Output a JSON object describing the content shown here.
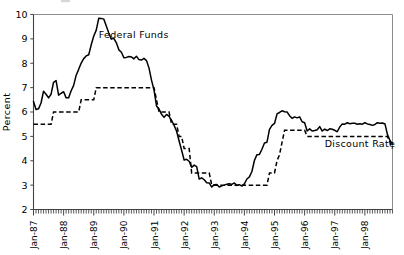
{
  "chart_data": {
    "type": "line",
    "title": "",
    "xlabel": "",
    "ylabel": "Percent",
    "ylim": [
      2,
      10
    ],
    "ytick_labels": [
      "10",
      "9",
      "8",
      "7",
      "6",
      "5",
      "4",
      "3",
      "2"
    ],
    "ytick_values": [
      10,
      9,
      8,
      7,
      6,
      5,
      4,
      3,
      2
    ],
    "xtick_labels": [
      "Jan-87",
      "Jan-88",
      "Jan-89",
      "Jan-90",
      "Jan-91",
      "Jan-92",
      "Jan-93",
      "Jan-94",
      "Jan-95",
      "Jan-96",
      "Jan-97",
      "Jan-98"
    ],
    "xtick_values": [
      0,
      12,
      24,
      36,
      48,
      60,
      72,
      84,
      96,
      108,
      120,
      132
    ],
    "x_minor_ticks": "monthly",
    "x_range_start": "Jan-87",
    "x_range_end": "Dec-98",
    "grid": false,
    "legend": "inline-annotations",
    "annotations": [
      {
        "text": "Federal Funds",
        "x_index": 26,
        "y_value": 9.05
      },
      {
        "text": "Discount Rate",
        "x_index": 116,
        "y_value": 4.55
      }
    ],
    "series": [
      {
        "name": "Federal Funds",
        "style": "solid",
        "color": "#000000",
        "values": [
          6.43,
          6.1,
          6.13,
          6.37,
          6.85,
          6.73,
          6.58,
          6.73,
          7.22,
          7.29,
          6.69,
          6.77,
          6.83,
          6.58,
          6.58,
          6.87,
          7.09,
          7.51,
          7.75,
          8.01,
          8.19,
          8.3,
          8.35,
          8.76,
          9.12,
          9.36,
          9.85,
          9.84,
          9.81,
          9.53,
          9.24,
          8.99,
          9.02,
          8.84,
          8.55,
          8.45,
          8.23,
          8.24,
          8.28,
          8.26,
          8.18,
          8.29,
          8.15,
          8.13,
          8.2,
          8.11,
          7.81,
          7.31,
          6.91,
          6.25,
          6.12,
          5.91,
          5.78,
          5.9,
          5.82,
          5.66,
          5.45,
          5.21,
          4.81,
          4.43,
          4.03,
          4.06,
          3.98,
          3.73,
          3.82,
          3.76,
          3.25,
          3.3,
          3.22,
          3.1,
          3.09,
          2.92,
          3.02,
          3.03,
          2.92,
          2.97,
          3.0,
          3.04,
          3.06,
          3.03,
          3.09,
          2.99,
          3.02,
          2.96,
          3.05,
          3.25,
          3.34,
          3.56,
          4.01,
          4.25,
          4.26,
          4.47,
          4.73,
          4.76,
          5.29,
          5.45,
          5.53,
          5.92,
          5.98,
          6.05,
          6.01,
          6.0,
          5.85,
          5.74,
          5.8,
          5.76,
          5.8,
          5.6,
          5.56,
          5.22,
          5.31,
          5.22,
          5.24,
          5.27,
          5.4,
          5.22,
          5.3,
          5.24,
          5.31,
          5.29,
          5.25,
          5.19,
          5.39,
          5.51,
          5.5,
          5.56,
          5.52,
          5.54,
          5.54,
          5.5,
          5.52,
          5.5,
          5.56,
          5.51,
          5.49,
          5.45,
          5.49,
          5.56,
          5.54,
          5.55,
          5.51,
          5.07,
          4.83,
          4.68
        ]
      },
      {
        "name": "Discount Rate",
        "style": "dashed",
        "color": "#000000",
        "values": [
          5.5,
          5.5,
          5.5,
          5.5,
          5.5,
          5.5,
          5.5,
          5.5,
          6.0,
          6.0,
          6.0,
          6.0,
          6.0,
          6.0,
          6.0,
          6.0,
          6.0,
          6.0,
          6.0,
          6.5,
          6.5,
          6.5,
          6.5,
          6.5,
          6.5,
          7.0,
          7.0,
          7.0,
          7.0,
          7.0,
          7.0,
          7.0,
          7.0,
          7.0,
          7.0,
          7.0,
          7.0,
          7.0,
          7.0,
          7.0,
          7.0,
          7.0,
          7.0,
          7.0,
          7.0,
          7.0,
          7.0,
          7.0,
          7.0,
          6.5,
          6.0,
          6.0,
          6.0,
          6.0,
          6.0,
          5.5,
          5.5,
          5.5,
          5.0,
          5.0,
          4.5,
          4.5,
          4.5,
          3.5,
          3.5,
          3.5,
          3.5,
          3.5,
          3.5,
          3.5,
          3.5,
          3.0,
          3.0,
          3.0,
          3.0,
          3.0,
          3.0,
          3.0,
          3.0,
          3.0,
          3.0,
          3.0,
          3.0,
          3.0,
          3.0,
          3.0,
          3.0,
          3.0,
          3.0,
          3.0,
          3.0,
          3.0,
          3.0,
          3.0,
          3.5,
          3.5,
          3.5,
          4.0,
          4.25,
          4.75,
          5.25,
          5.25,
          5.25,
          5.25,
          5.25,
          5.25,
          5.25,
          5.25,
          5.25,
          5.0,
          5.0,
          5.0,
          5.0,
          5.0,
          5.0,
          5.0,
          5.0,
          5.0,
          5.0,
          5.0,
          5.0,
          5.0,
          5.0,
          5.0,
          5.0,
          5.0,
          5.0,
          5.0,
          5.0,
          5.0,
          5.0,
          5.0,
          5.0,
          5.0,
          5.0,
          5.0,
          5.0,
          5.0,
          5.0,
          5.0,
          5.0,
          5.0,
          4.75,
          4.5
        ]
      }
    ]
  }
}
